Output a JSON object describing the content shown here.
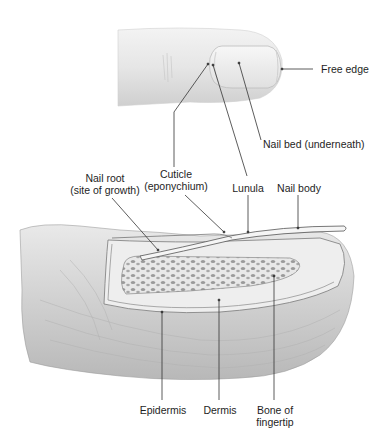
{
  "figure": {
    "views": [
      "External view of fingertip",
      "Cutaway of fingertip"
    ]
  },
  "labels": {
    "free_edge": "Free edge",
    "nail_bed": "Nail bed (underneath)",
    "nail_root_line1": "Nail root",
    "nail_root_line2": "(site of growth)",
    "cuticle_line1": "Cuticle",
    "cuticle_line2": "(eponychium)",
    "lunula": "Lunula",
    "nail_body": "Nail body",
    "epidermis": "Epidermis",
    "dermis": "Dermis",
    "bone_line1": "Bone of",
    "bone_line2": "fingertip"
  },
  "colors": {
    "skin_light": "#efefef",
    "skin_mid": "#d9d9d9",
    "skin_dark": "#bdbdbd",
    "line": "#333333",
    "bone": "#e2e2e2"
  }
}
